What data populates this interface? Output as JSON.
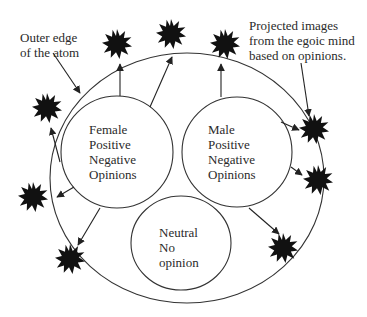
{
  "annotations": {
    "outer_edge": [
      "Outer edge",
      "of the atom"
    ],
    "projected": [
      "Projected images",
      "from the egoic mind",
      "based on opinions."
    ]
  },
  "circles": {
    "female": [
      "Female",
      "Positive",
      "Negative",
      "Opinions"
    ],
    "male": [
      "Male",
      "Positive",
      "Negative",
      "Opinions"
    ],
    "neutral": [
      "Neutral",
      "No",
      "opinion"
    ]
  },
  "colors": {
    "stroke": "#333333",
    "star_fill": "#111111",
    "text": "#2a2a2a",
    "background": "#ffffff"
  },
  "stars": [
    {
      "name": "star-top-left",
      "x": 117,
      "y": 44
    },
    {
      "name": "star-top-center",
      "x": 171,
      "y": 34
    },
    {
      "name": "star-top-right",
      "x": 225,
      "y": 44
    },
    {
      "name": "star-left-upper",
      "x": 47,
      "y": 108
    },
    {
      "name": "star-right-upper",
      "x": 314,
      "y": 129
    },
    {
      "name": "star-right-middle",
      "x": 318,
      "y": 180
    },
    {
      "name": "star-left-lower",
      "x": 33,
      "y": 197
    },
    {
      "name": "star-bottom-left",
      "x": 70,
      "y": 259
    },
    {
      "name": "star-bottom-right",
      "x": 283,
      "y": 248
    }
  ]
}
